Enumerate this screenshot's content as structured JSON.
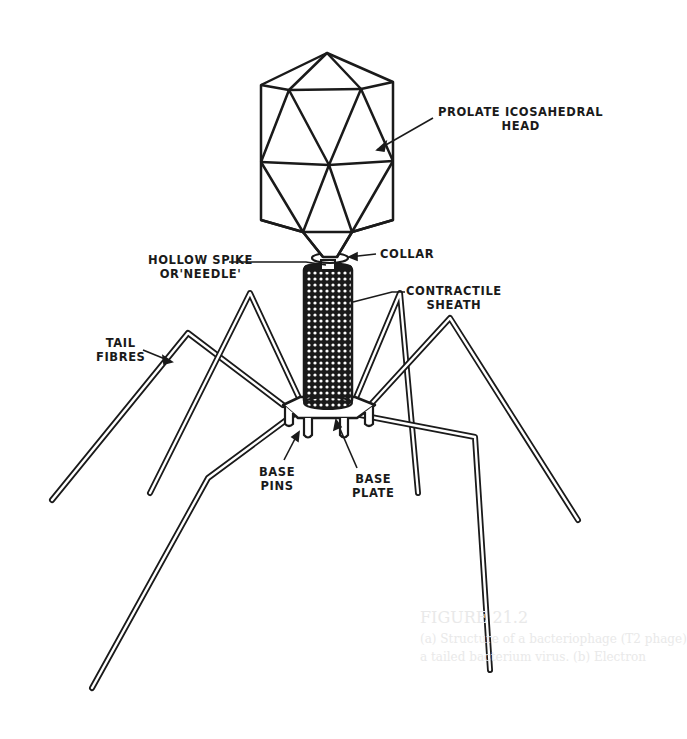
{
  "figure": {
    "stroke_color": "#1a1a1a",
    "background_color": "#ffffff"
  },
  "labels": {
    "head": {
      "line1": "PROLATE ICOSAHEDRAL",
      "line2": "HEAD"
    },
    "collar": {
      "line1": "COLLAR"
    },
    "spike": {
      "line1": "HOLLOW SPIKE",
      "line2": "OR'NEEDLE'"
    },
    "sheath": {
      "line1": "CONTRACTILE",
      "line2": "SHEATH"
    },
    "fibres": {
      "line1": "TAIL",
      "line2": "FIBRES"
    },
    "pins": {
      "line1": "BASE",
      "line2": "PINS"
    },
    "plate": {
      "line1": "BASE",
      "line2": "PLATE"
    }
  },
  "bleed_through": {
    "line1": "FIGURE 21.2",
    "line2": "(a) Structure of a bacteriophage (T2 phage)",
    "line3": "a tailed bacterium virus. (b) Electron"
  }
}
